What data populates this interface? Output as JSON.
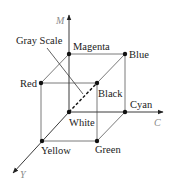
{
  "diagram": {
    "axes": {
      "m": {
        "label": "M"
      },
      "c": {
        "label": "C"
      },
      "y": {
        "label": "Y"
      }
    },
    "vertices": {
      "magenta": {
        "label": "Magenta"
      },
      "blue": {
        "label": "Blue"
      },
      "red": {
        "label": "Red"
      },
      "black": {
        "label": "Black"
      },
      "white": {
        "label": "White"
      },
      "cyan": {
        "label": "Cyan"
      },
      "yellow": {
        "label": "Yellow"
      },
      "green": {
        "label": "Green"
      }
    },
    "annotations": {
      "gray_scale": {
        "label": "Gray Scale"
      }
    },
    "colors": {
      "edge": "#7a7a7a",
      "axis": "#3a3a3a",
      "point": "#111111",
      "axis_label": "#8a8a8a"
    }
  }
}
